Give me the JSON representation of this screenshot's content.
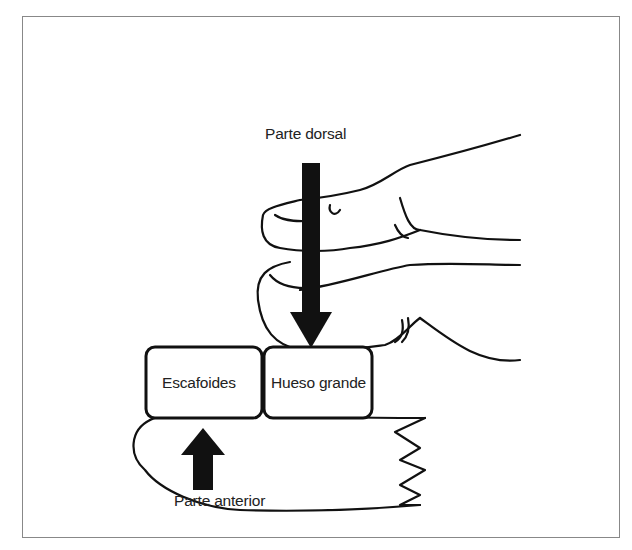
{
  "figure": {
    "labels": {
      "dorsal": "Parte dorsal",
      "scaphoid": "Escafoides",
      "capitate": "Hueso grande",
      "anterior": "Parte anterior"
    },
    "colors": {
      "ink": "#111111",
      "frame": "#888888",
      "background": "#ffffff"
    },
    "arrows": [
      {
        "name": "dorsal-force",
        "direction": "down"
      },
      {
        "name": "anterior-force",
        "direction": "up"
      }
    ]
  }
}
